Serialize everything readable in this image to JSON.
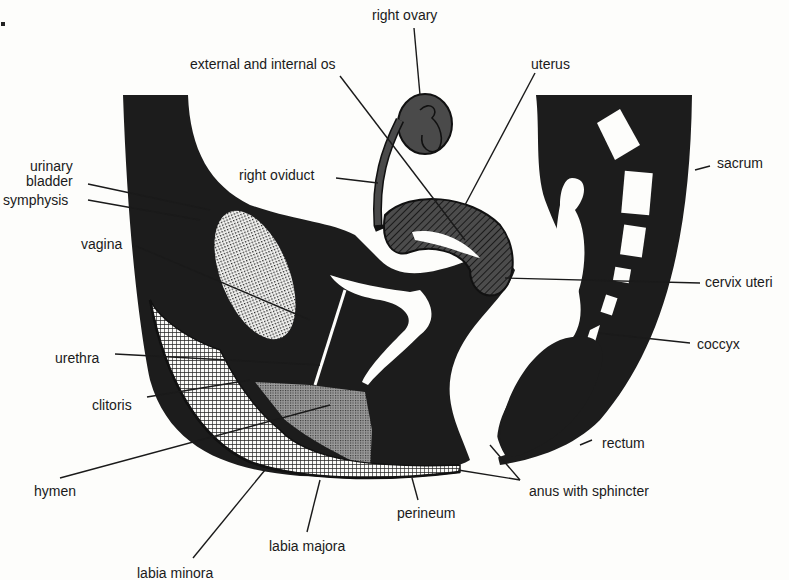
{
  "diagram": {
    "title": "",
    "colors": {
      "background": "#fdfdfb",
      "tissue": "#1c1c1c",
      "organ_gray": "#4a4a4a",
      "leader_line": "#1a1a1a",
      "label_text": "#1a1a1a"
    },
    "labels": [
      {
        "id": "right-ovary",
        "text": "right ovary",
        "x": 372,
        "y": 8
      },
      {
        "id": "external-and-internal-os",
        "text": "external and internal os",
        "x": 190,
        "y": 57
      },
      {
        "id": "uterus",
        "text": "uterus",
        "x": 531,
        "y": 57
      },
      {
        "id": "urinary-bladder",
        "text": "urinary\nbladder",
        "x": 26,
        "y": 159
      },
      {
        "id": "symphysis",
        "text": "symphysis",
        "x": 3,
        "y": 193
      },
      {
        "id": "right-oviduct",
        "text": "right oviduct",
        "x": 239,
        "y": 168
      },
      {
        "id": "sacrum",
        "text": "sacrum",
        "x": 717,
        "y": 156
      },
      {
        "id": "vagina",
        "text": "vagina",
        "x": 81,
        "y": 237
      },
      {
        "id": "cervix-uteri",
        "text": "cervix uteri",
        "x": 705,
        "y": 275
      },
      {
        "id": "coccyx",
        "text": "coccyx",
        "x": 697,
        "y": 337
      },
      {
        "id": "urethra",
        "text": "urethra",
        "x": 55,
        "y": 351
      },
      {
        "id": "clitoris",
        "text": "clitoris",
        "x": 92,
        "y": 398
      },
      {
        "id": "rectum",
        "text": "rectum",
        "x": 602,
        "y": 436
      },
      {
        "id": "hymen",
        "text": "hymen",
        "x": 34,
        "y": 484
      },
      {
        "id": "anus-with-sphincter",
        "text": "anus with sphincter",
        "x": 529,
        "y": 484
      },
      {
        "id": "perineum",
        "text": "perineum",
        "x": 397,
        "y": 506
      },
      {
        "id": "labia-majora",
        "text": "labia majora",
        "x": 269,
        "y": 539
      },
      {
        "id": "labia-minora",
        "text": "labia minora",
        "x": 137,
        "y": 566
      }
    ]
  }
}
